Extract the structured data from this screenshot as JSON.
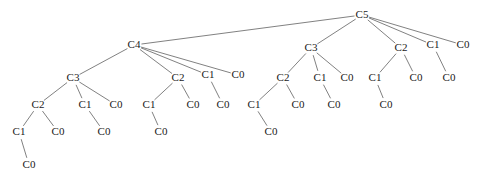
{
  "figure": {
    "type": "tree-diagram",
    "title": "",
    "background_color": "#ffffff",
    "edge_color": "#4a4a4a",
    "label_color": "#1a1a1a",
    "bleed_text_top": ""
  },
  "tree": {
    "root_id": "n0",
    "levels": 7,
    "nodes": [
      {
        "id": "n0",
        "label": "C5",
        "x": 362,
        "y": 15,
        "level": 0,
        "parent": null
      },
      {
        "id": "n1",
        "label": "C4",
        "x": 134,
        "y": 45,
        "level": 1,
        "parent": "n0"
      },
      {
        "id": "n2",
        "label": "C3",
        "x": 311,
        "y": 48,
        "level": 1,
        "parent": "n0"
      },
      {
        "id": "n3",
        "label": "C2",
        "x": 401,
        "y": 48,
        "level": 1,
        "parent": "n0"
      },
      {
        "id": "n4",
        "label": "C1",
        "x": 433,
        "y": 45,
        "level": 1,
        "parent": "n0"
      },
      {
        "id": "n5",
        "label": "C0",
        "x": 463,
        "y": 45,
        "level": 1,
        "parent": "n0"
      },
      {
        "id": "n6",
        "label": "C3",
        "x": 73,
        "y": 78,
        "level": 2,
        "parent": "n1"
      },
      {
        "id": "n7",
        "label": "C2",
        "x": 178,
        "y": 78,
        "level": 2,
        "parent": "n1"
      },
      {
        "id": "n8",
        "label": "C1",
        "x": 208,
        "y": 75,
        "level": 2,
        "parent": "n1"
      },
      {
        "id": "n9",
        "label": "C0",
        "x": 238,
        "y": 75,
        "level": 2,
        "parent": "n1"
      },
      {
        "id": "n10",
        "label": "C2",
        "x": 283,
        "y": 78,
        "level": 2,
        "parent": "n2"
      },
      {
        "id": "n11",
        "label": "C1",
        "x": 320,
        "y": 78,
        "level": 2,
        "parent": "n2"
      },
      {
        "id": "n12",
        "label": "C0",
        "x": 347,
        "y": 78,
        "level": 2,
        "parent": "n2"
      },
      {
        "id": "n13",
        "label": "C1",
        "x": 375,
        "y": 78,
        "level": 2,
        "parent": "n3"
      },
      {
        "id": "n14",
        "label": "C0",
        "x": 416,
        "y": 78,
        "level": 2,
        "parent": "n3"
      },
      {
        "id": "n15",
        "label": "C0",
        "x": 449,
        "y": 78,
        "level": 2,
        "parent": "n4"
      },
      {
        "id": "n16",
        "label": "C2",
        "x": 38,
        "y": 105,
        "level": 3,
        "parent": "n6"
      },
      {
        "id": "n17",
        "label": "C1",
        "x": 85,
        "y": 105,
        "level": 3,
        "parent": "n6"
      },
      {
        "id": "n18",
        "label": "C0",
        "x": 116,
        "y": 105,
        "level": 3,
        "parent": "n6"
      },
      {
        "id": "n19",
        "label": "C1",
        "x": 149,
        "y": 105,
        "level": 3,
        "parent": "n7"
      },
      {
        "id": "n20",
        "label": "C0",
        "x": 193,
        "y": 105,
        "level": 3,
        "parent": "n7"
      },
      {
        "id": "n21",
        "label": "C0",
        "x": 223,
        "y": 105,
        "level": 3,
        "parent": "n8"
      },
      {
        "id": "n22",
        "label": "C1",
        "x": 254,
        "y": 105,
        "level": 3,
        "parent": "n10"
      },
      {
        "id": "n23",
        "label": "C0",
        "x": 298,
        "y": 105,
        "level": 3,
        "parent": "n10"
      },
      {
        "id": "n24",
        "label": "C0",
        "x": 334,
        "y": 105,
        "level": 3,
        "parent": "n11"
      },
      {
        "id": "n25",
        "label": "C0",
        "x": 386,
        "y": 105,
        "level": 3,
        "parent": "n13"
      },
      {
        "id": "n26",
        "label": "C1",
        "x": 19,
        "y": 132,
        "level": 4,
        "parent": "n16"
      },
      {
        "id": "n27",
        "label": "C0",
        "x": 58,
        "y": 132,
        "level": 4,
        "parent": "n16"
      },
      {
        "id": "n28",
        "label": "C0",
        "x": 104,
        "y": 132,
        "level": 4,
        "parent": "n17"
      },
      {
        "id": "n29",
        "label": "C0",
        "x": 161,
        "y": 132,
        "level": 4,
        "parent": "n19"
      },
      {
        "id": "n30",
        "label": "C0",
        "x": 271,
        "y": 132,
        "level": 4,
        "parent": "n22"
      },
      {
        "id": "n31",
        "label": "C0",
        "x": 29,
        "y": 165,
        "level": 5,
        "parent": "n26"
      }
    ]
  }
}
